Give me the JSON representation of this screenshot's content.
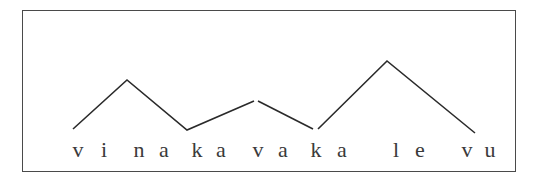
{
  "diagram": {
    "type": "pitch-contour",
    "phrase": "vi naka vaka le vu",
    "letters": [
      {
        "ch": "v",
        "x": 78
      },
      {
        "ch": "i",
        "x": 104
      },
      {
        "ch": "n",
        "x": 139
      },
      {
        "ch": "a",
        "x": 164
      },
      {
        "ch": "k",
        "x": 197
      },
      {
        "ch": "a",
        "x": 221
      },
      {
        "ch": "v",
        "x": 258
      },
      {
        "ch": "a",
        "x": 283
      },
      {
        "ch": "k",
        "x": 316
      },
      {
        "ch": "a",
        "x": 342
      },
      {
        "ch": "l",
        "x": 396
      },
      {
        "ch": "e",
        "x": 420
      },
      {
        "ch": "v",
        "x": 467
      },
      {
        "ch": "u",
        "x": 490
      }
    ],
    "contour_segments": [
      [
        [
          73,
          129
        ],
        [
          127,
          80
        ],
        [
          187,
          130
        ],
        [
          254,
          101
        ]
      ],
      [
        [
          258,
          101
        ],
        [
          313,
          129
        ]
      ],
      [
        [
          318,
          129
        ],
        [
          387,
          61
        ],
        [
          475,
          133
        ]
      ]
    ],
    "line_color": "#2a2a2a",
    "frame_color": "#4a4a4a"
  }
}
